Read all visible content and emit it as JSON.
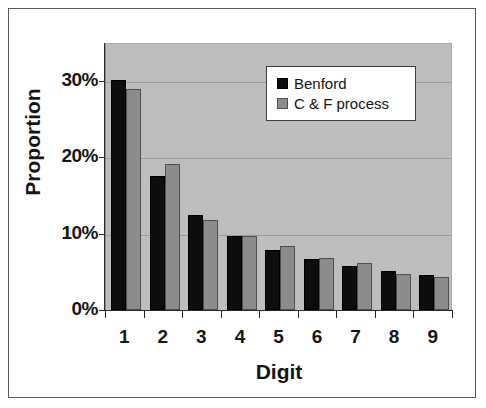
{
  "chart_data": {
    "type": "bar",
    "title": "",
    "xlabel": "Digit",
    "ylabel": "Proportion",
    "categories": [
      "1",
      "2",
      "3",
      "4",
      "5",
      "6",
      "7",
      "8",
      "9"
    ],
    "series": [
      {
        "name": "Benford",
        "color": "#0d0d0d",
        "values": [
          30.1,
          17.6,
          12.5,
          9.7,
          7.9,
          6.7,
          5.8,
          5.1,
          4.6
        ]
      },
      {
        "name": "C & F process",
        "color": "#8c8c8c",
        "values": [
          29.0,
          19.1,
          11.8,
          9.7,
          8.4,
          6.8,
          6.2,
          4.7,
          4.3
        ]
      }
    ],
    "ylim": [
      0,
      35
    ],
    "yticks": [
      0,
      10,
      20,
      30
    ],
    "ytick_labels": [
      "0%",
      "10%",
      "20%",
      "30%"
    ],
    "grid": true,
    "legend_position": "top-right",
    "plot_background": "#bdbdbd",
    "figure_background": "#ffffff"
  },
  "legend": {
    "entries": [
      {
        "label": "Benford"
      },
      {
        "label": "C & F process"
      }
    ]
  }
}
